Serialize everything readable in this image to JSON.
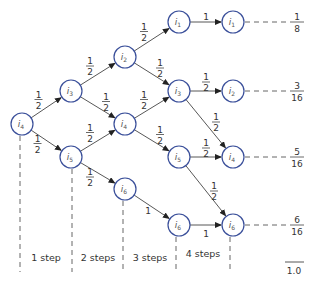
{
  "diagram": {
    "nodes": [
      {
        "id": "n0",
        "label": "i",
        "sub": "4",
        "x": 22,
        "y": 124
      },
      {
        "id": "n1",
        "label": "i",
        "sub": "3",
        "x": 71,
        "y": 91
      },
      {
        "id": "n2",
        "label": "i",
        "sub": "5",
        "x": 71,
        "y": 157
      },
      {
        "id": "n3",
        "label": "i",
        "sub": "2",
        "x": 125,
        "y": 57
      },
      {
        "id": "n4",
        "label": "i",
        "sub": "4",
        "x": 125,
        "y": 124
      },
      {
        "id": "n5",
        "label": "i",
        "sub": "6",
        "x": 125,
        "y": 189
      },
      {
        "id": "n6",
        "label": "i",
        "sub": "1",
        "x": 179,
        "y": 22
      },
      {
        "id": "n7",
        "label": "i",
        "sub": "3",
        "x": 179,
        "y": 91
      },
      {
        "id": "n8",
        "label": "i",
        "sub": "5",
        "x": 179,
        "y": 157
      },
      {
        "id": "n9",
        "label": "i",
        "sub": "6",
        "x": 179,
        "y": 225
      },
      {
        "id": "n10",
        "label": "i",
        "sub": "1",
        "x": 233,
        "y": 22
      },
      {
        "id": "n11",
        "label": "i",
        "sub": "2",
        "x": 233,
        "y": 91
      },
      {
        "id": "n12",
        "label": "i",
        "sub": "4",
        "x": 233,
        "y": 157
      },
      {
        "id": "n13",
        "label": "i",
        "sub": "6",
        "x": 233,
        "y": 225
      }
    ],
    "edges": [
      {
        "from": "n0",
        "to": "n1",
        "label": "1/2"
      },
      {
        "from": "n0",
        "to": "n2",
        "label": "1/2"
      },
      {
        "from": "n1",
        "to": "n3",
        "label": "1/2"
      },
      {
        "from": "n1",
        "to": "n4",
        "label": "1/2"
      },
      {
        "from": "n2",
        "to": "n4",
        "label": "1/2"
      },
      {
        "from": "n2",
        "to": "n5",
        "label": "1/2"
      },
      {
        "from": "n3",
        "to": "n6",
        "label": "1/2"
      },
      {
        "from": "n3",
        "to": "n7",
        "label": "1/2"
      },
      {
        "from": "n4",
        "to": "n7",
        "label": "1/2"
      },
      {
        "from": "n4",
        "to": "n8",
        "label": "1/2"
      },
      {
        "from": "n5",
        "to": "n9",
        "label": "1"
      },
      {
        "from": "n6",
        "to": "n10",
        "label": "1"
      },
      {
        "from": "n7",
        "to": "n11",
        "label": "1/2"
      },
      {
        "from": "n7",
        "to": "n12",
        "label": "1/2"
      },
      {
        "from": "n8",
        "to": "n12",
        "label": "1/2"
      },
      {
        "from": "n8",
        "to": "n13",
        "label": "1/2"
      },
      {
        "from": "n9",
        "to": "n13",
        "label": "1"
      }
    ],
    "outcomes": [
      {
        "num": "1",
        "den": "8"
      },
      {
        "num": "3",
        "den": "16"
      },
      {
        "num": "5",
        "den": "16"
      },
      {
        "num": "6",
        "den": "16"
      }
    ],
    "total": "1.0",
    "steps": [
      "1 step",
      "2 steps",
      "3 steps",
      "4 steps"
    ]
  }
}
